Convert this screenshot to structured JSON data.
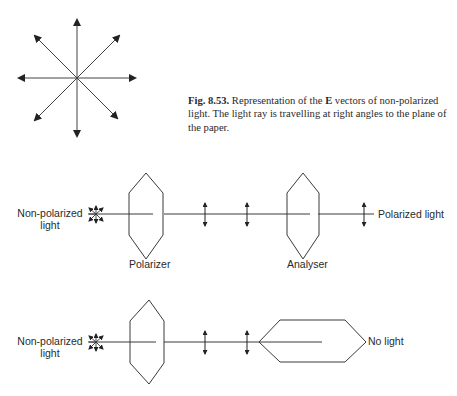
{
  "figure": {
    "number": "Fig. 8.53.",
    "caption_pre": "Representation of the ",
    "caption_bold": "E",
    "caption_post": " vectors of non-polarized light. The light ray is travelling at right angles to the plane of the paper."
  },
  "diagram_top": {
    "source_label_line1": "Non-polarized",
    "source_label_line2": "light",
    "polarizer_label": "Polarizer",
    "analyser_label": "Analyser",
    "output_label": "Polarized light"
  },
  "diagram_bottom": {
    "source_label_line1": "Non-polarized",
    "source_label_line2": "light",
    "output_label": "No light"
  },
  "colors": {
    "line": "#3a3a3a",
    "text": "#2a2a2a"
  }
}
